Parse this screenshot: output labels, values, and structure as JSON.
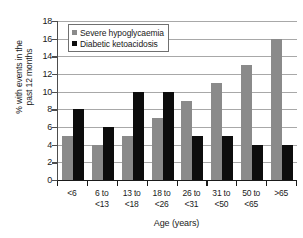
{
  "chart_data": {
    "type": "bar",
    "title": "",
    "xlabel": "Age (years)",
    "ylabel": "% with events in the\npast 12 months",
    "categories": [
      "<6",
      "6 to\n<13",
      "13 to\n<18",
      "18 to\n<26",
      "26 to\n<31",
      "31 to\n<50",
      "50 to\n<65",
      ">65"
    ],
    "series": [
      {
        "name": "Severe hypoglycaemia",
        "color": "#8a8a8a",
        "values": [
          5,
          4,
          5,
          7,
          9,
          11,
          13,
          16
        ]
      },
      {
        "name": "Diabetic ketoacidosis",
        "color": "#0d0d0d",
        "values": [
          8,
          6,
          10,
          10,
          5,
          5,
          4,
          4
        ]
      }
    ],
    "ylim": [
      0,
      18
    ],
    "ytick_step": 2,
    "yticks": [
      "0",
      "2",
      "4",
      "6",
      "8",
      "10",
      "12",
      "14",
      "16",
      "18"
    ],
    "grid": true,
    "legend_position": "upper-left-inside"
  },
  "colors": {
    "gridline": "#a8a8a8",
    "axis": "#1a1a1a",
    "background": "#ffffff",
    "series_gray": "#8a8a8a",
    "series_black": "#0d0d0d"
  }
}
